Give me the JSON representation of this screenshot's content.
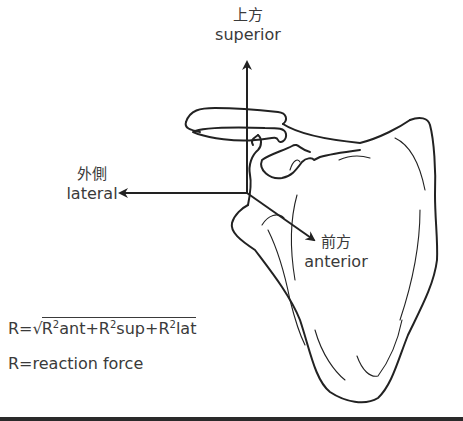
{
  "axes": {
    "superior": {
      "jp": "上方",
      "en": "superior"
    },
    "lateral": {
      "jp": "外側",
      "en": "lateral"
    },
    "anterior": {
      "jp": "前方",
      "en": "anterior"
    }
  },
  "formula": {
    "lhs": "R=",
    "radical": "√",
    "terms": [
      {
        "base": "R",
        "exp": "2",
        "sub": "ant"
      },
      {
        "op": "+"
      },
      {
        "base": "R",
        "exp": "2",
        "sub": "sup"
      },
      {
        "op": "+"
      },
      {
        "base": "R",
        "exp": "2",
        "sub": "lat"
      }
    ],
    "definition": "R=reaction force"
  },
  "colors": {
    "line": "#222222",
    "text": "#3a3a3a",
    "background": "#ffffff"
  }
}
